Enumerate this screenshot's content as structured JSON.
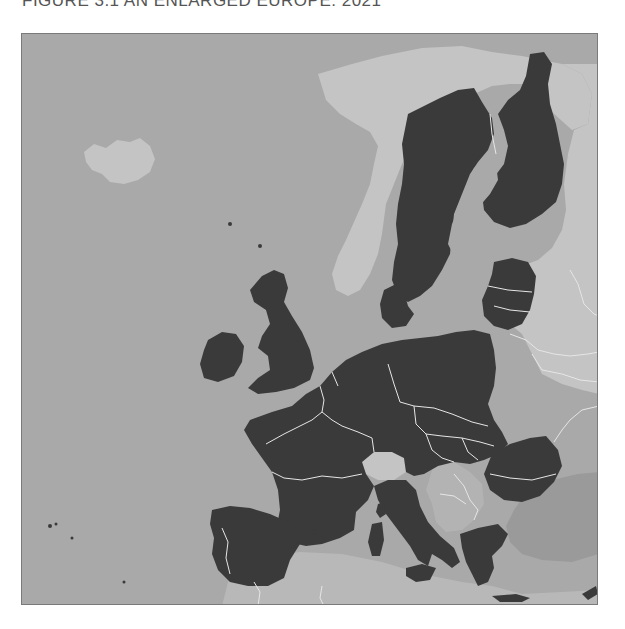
{
  "figure": {
    "title": "FIGURE 3.1  AN ENLARGED EUROPE: 2021"
  },
  "map": {
    "region": "Europe",
    "legend_implicit": {
      "eu_members": "dark fill",
      "non_members": "light fill"
    },
    "colors": {
      "sea": "#a9a9a9",
      "eu_member": "#3a3a3a",
      "non_member_land": "#c4c4c4",
      "non_member_mid": "#b3b3b3",
      "turkey_candidates": "#9a9a9a",
      "borders": "#e6e6e6",
      "frame": "#7a7a7a"
    },
    "highlighted_countries": [
      "Ireland",
      "United Kingdom",
      "Portugal",
      "Spain",
      "France",
      "Belgium",
      "Netherlands",
      "Luxembourg",
      "Germany",
      "Denmark",
      "Sweden",
      "Finland",
      "Estonia",
      "Latvia",
      "Lithuania",
      "Poland",
      "Czech Republic",
      "Slovakia",
      "Austria",
      "Hungary",
      "Slovenia",
      "Croatia",
      "Italy",
      "Romania",
      "Bulgaria",
      "Greece",
      "Malta",
      "Cyprus"
    ],
    "other_countries": [
      "Iceland",
      "Norway",
      "Switzerland",
      "Bosnia and Herzegovina",
      "Serbia",
      "Montenegro",
      "Kosovo",
      "North Macedonia",
      "Albania",
      "Belarus",
      "Ukraine",
      "Moldova",
      "Russia",
      "Turkey",
      "Morocco",
      "Algeria",
      "Tunisia",
      "Libya"
    ]
  }
}
